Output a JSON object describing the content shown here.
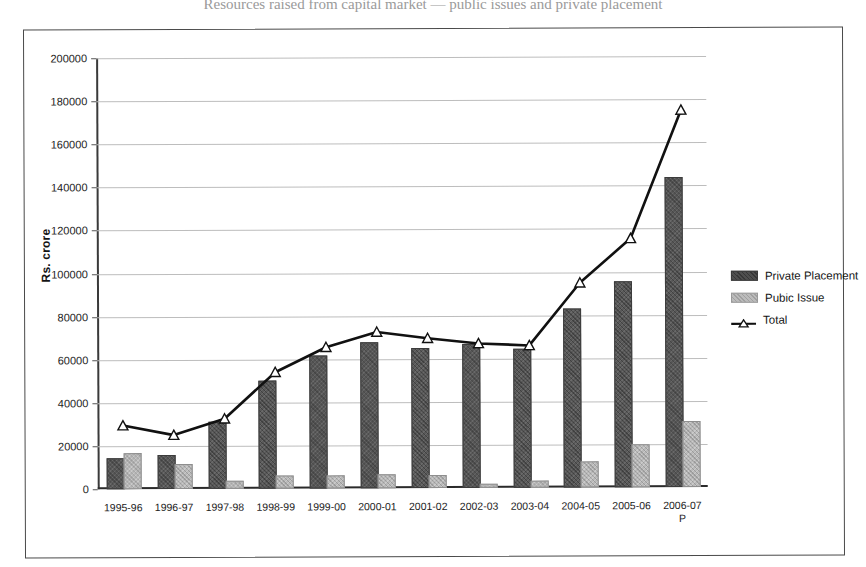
{
  "caption_sliver": "Resources raised from capital market — public issues and private placement",
  "chart_data": {
    "type": "bar",
    "title": "",
    "subtitle": "",
    "xlabel": "",
    "ylabel": "Rs. crore",
    "ylim": [
      0,
      200000
    ],
    "ytick_step": 20000,
    "ytick_labels": [
      "200000",
      "180000",
      "160000",
      "140000",
      "120000",
      "100000",
      "80000",
      "60000",
      "40000",
      "20000",
      "0"
    ],
    "ytick_values": [
      200000,
      180000,
      160000,
      140000,
      120000,
      100000,
      80000,
      60000,
      40000,
      20000,
      0
    ],
    "grid": true,
    "grid_axis": "y",
    "legend_position": "right",
    "categories": [
      "1995-96",
      "1996-97",
      "1997-98",
      "1998-99",
      "1999-00",
      "2000-01",
      "2001-02",
      "2002-03",
      "2003-04",
      "2004-05",
      "2005-06",
      "2006-07"
    ],
    "category_sublabels": [
      "",
      "",
      "",
      "",
      "",
      "",
      "",
      "",
      "",
      "",
      "",
      "P"
    ],
    "series": [
      {
        "name": "Private Placement",
        "kind": "bar",
        "color": "#595959",
        "values": [
          13500,
          15000,
          30000,
          49000,
          61000,
          67000,
          64000,
          66000,
          63500,
          82000,
          94500,
          143000
        ]
      },
      {
        "name": "Pubic Issue",
        "kind": "bar",
        "color": "#b9b9b9",
        "values": [
          16000,
          10500,
          3000,
          5000,
          5000,
          5500,
          5000,
          1000,
          2500,
          11000,
          19000,
          29500
        ]
      },
      {
        "name": "Total",
        "kind": "line",
        "color": "#111111",
        "marker": "triangle",
        "values": [
          29500,
          25000,
          32500,
          54000,
          65500,
          72500,
          69500,
          67000,
          66000,
          95000,
          115500,
          175000
        ]
      }
    ]
  },
  "legend": {
    "entries": [
      {
        "label": "Private Placement",
        "swatch": "private"
      },
      {
        "label": "Pubic Issue",
        "swatch": "public"
      },
      {
        "label": "Total",
        "swatch": "total"
      }
    ]
  }
}
